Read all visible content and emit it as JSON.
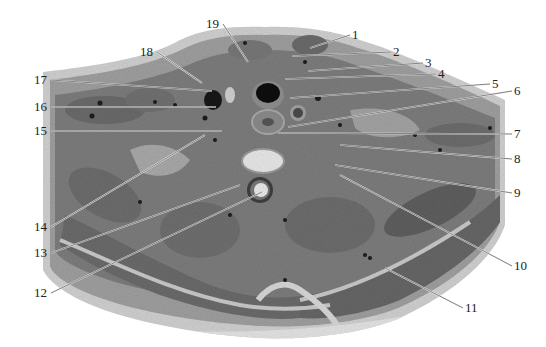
{
  "figure": {
    "type": "anatomical cross-section (axial section of neck)",
    "labels": [
      {
        "num": "1",
        "tx": 352,
        "ty": 35,
        "x2": 310,
        "y2": 48,
        "side": "right"
      },
      {
        "num": "2",
        "tx": 393,
        "ty": 52,
        "x2": 292,
        "y2": 56,
        "side": "right"
      },
      {
        "num": "3",
        "tx": 425,
        "ty": 63,
        "x2": 308,
        "y2": 71,
        "side": "right"
      },
      {
        "num": "4",
        "tx": 438,
        "ty": 74,
        "x2": 285,
        "y2": 79,
        "side": "right"
      },
      {
        "num": "5",
        "tx": 492,
        "ty": 84,
        "x2": 290,
        "y2": 98,
        "side": "right"
      },
      {
        "num": "6",
        "tx": 514,
        "ty": 91,
        "x2": 288,
        "y2": 127,
        "side": "right"
      },
      {
        "num": "7",
        "tx": 514,
        "ty": 134,
        "x2": 278,
        "y2": 133,
        "side": "right"
      },
      {
        "num": "8",
        "tx": 514,
        "ty": 159,
        "x2": 340,
        "y2": 145,
        "side": "right"
      },
      {
        "num": "9",
        "tx": 514,
        "ty": 193,
        "x2": 335,
        "y2": 165,
        "side": "right"
      },
      {
        "num": "10",
        "tx": 514,
        "ty": 266,
        "x2": 340,
        "y2": 175,
        "side": "right"
      },
      {
        "num": "11",
        "tx": 465,
        "ty": 308,
        "x2": 385,
        "y2": 268,
        "side": "right"
      },
      {
        "num": "12",
        "tx": 36,
        "ty": 293,
        "x2": 262,
        "y2": 192,
        "side": "left"
      },
      {
        "num": "13",
        "tx": 36,
        "ty": 253,
        "x2": 240,
        "y2": 185,
        "side": "left"
      },
      {
        "num": "14",
        "tx": 36,
        "ty": 227,
        "x2": 205,
        "y2": 135,
        "side": "left"
      },
      {
        "num": "15",
        "tx": 36,
        "ty": 131,
        "x2": 222,
        "y2": 131,
        "side": "left"
      },
      {
        "num": "16",
        "tx": 36,
        "ty": 107,
        "x2": 216,
        "y2": 107,
        "side": "left"
      },
      {
        "num": "17",
        "tx": 36,
        "ty": 80,
        "x2": 212,
        "y2": 91,
        "side": "left"
      },
      {
        "num": "18",
        "tx": 142,
        "ty": 52,
        "x2": 202,
        "y2": 83,
        "side": "left"
      },
      {
        "num": "19",
        "tx": 208,
        "ty": 24,
        "x2": 248,
        "y2": 62,
        "side": "left"
      }
    ]
  },
  "colors": {
    "background": "#ffffff",
    "tissue_dark": "#5e5e5e",
    "tissue_mid": "#8a8a8a",
    "tissue_light": "#b5b5b5",
    "skin": "#d2d2d2",
    "label_text": "#222222",
    "leader_line": "#f2f2f2"
  }
}
